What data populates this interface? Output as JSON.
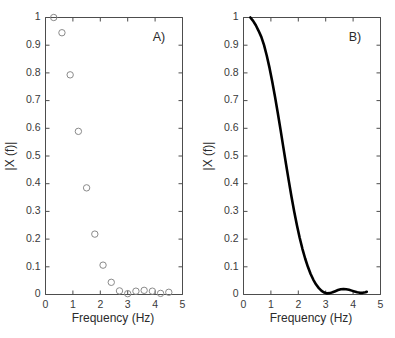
{
  "figure": {
    "background": "#ffffff",
    "width": 395,
    "height": 338
  },
  "chart_data": [
    {
      "type": "scatter",
      "panel_label": "A)",
      "title": "",
      "xlabel": "Frequency (Hz)",
      "ylabel": "|X (f)|",
      "xlim": [
        0,
        5
      ],
      "ylim": [
        0,
        1
      ],
      "xticks": [
        0,
        1,
        2,
        3,
        4,
        5
      ],
      "xticklabels": [
        "0",
        "1",
        "2",
        "3",
        "4",
        "5"
      ],
      "yticks": [
        0,
        0.1,
        0.2,
        0.3,
        0.4,
        0.5,
        0.6,
        0.7,
        0.8,
        0.9,
        1
      ],
      "yticklabels": [
        "0",
        "0.1",
        "0.2",
        "0.3",
        "0.4",
        "0.5",
        "0.6",
        "0.7",
        "0.8",
        "0.9",
        "1"
      ],
      "grid": false,
      "legend": "none",
      "marker": "open-circle",
      "marker_color": "#8a8a8a",
      "x": [
        0.3,
        0.6,
        0.9,
        1.2,
        1.5,
        1.8,
        2.1,
        2.4,
        2.7,
        3.0,
        3.3,
        3.6,
        3.9,
        4.2,
        4.5
      ],
      "values": [
        1.0,
        0.945,
        0.793,
        0.589,
        0.385,
        0.218,
        0.106,
        0.044,
        0.013,
        0.003,
        0.012,
        0.015,
        0.012,
        0.004,
        0.008
      ]
    },
    {
      "type": "line",
      "panel_label": "B)",
      "title": "",
      "xlabel": "Frequency (Hz)",
      "ylabel": "|X (f)|",
      "xlim": [
        0,
        5
      ],
      "ylim": [
        0,
        1
      ],
      "xticks": [
        0,
        1,
        2,
        3,
        4,
        5
      ],
      "xticklabels": [
        "0",
        "1",
        "2",
        "3",
        "4",
        "5"
      ],
      "yticks": [
        0,
        0.1,
        0.2,
        0.3,
        0.4,
        0.5,
        0.6,
        0.7,
        0.8,
        0.9,
        1
      ],
      "yticklabels": [
        "0",
        "0.1",
        "0.2",
        "0.3",
        "0.4",
        "0.5",
        "0.6",
        "0.7",
        "0.8",
        "0.9",
        "1"
      ],
      "grid": false,
      "legend": "none",
      "line_color": "#000000",
      "line_width": 2.6,
      "x": [
        0.25,
        0.35,
        0.45,
        0.55,
        0.65,
        0.75,
        0.85,
        0.95,
        1.05,
        1.15,
        1.25,
        1.35,
        1.45,
        1.55,
        1.65,
        1.75,
        1.85,
        1.95,
        2.05,
        2.15,
        2.25,
        2.35,
        2.45,
        2.55,
        2.65,
        2.75,
        2.85,
        2.95,
        3.05,
        3.15,
        3.25,
        3.35,
        3.45,
        3.55,
        3.65,
        3.75,
        3.85,
        3.95,
        4.05,
        4.15,
        4.25,
        4.35,
        4.45,
        4.5
      ],
      "values": [
        1.0,
        0.988,
        0.972,
        0.952,
        0.93,
        0.9,
        0.862,
        0.818,
        0.768,
        0.714,
        0.656,
        0.596,
        0.534,
        0.472,
        0.412,
        0.354,
        0.3,
        0.25,
        0.205,
        0.165,
        0.13,
        0.1,
        0.074,
        0.053,
        0.036,
        0.023,
        0.013,
        0.007,
        0.004,
        0.005,
        0.008,
        0.012,
        0.016,
        0.019,
        0.02,
        0.019,
        0.017,
        0.014,
        0.011,
        0.008,
        0.006,
        0.006,
        0.008,
        0.01
      ]
    }
  ]
}
